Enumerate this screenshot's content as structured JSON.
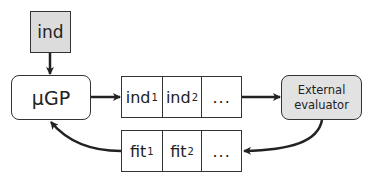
{
  "diagram": {
    "input_box": {
      "label": "ind"
    },
    "generator": {
      "label": "µGP"
    },
    "individuals_row": {
      "cells": [
        {
          "base": "ind",
          "sub": "1"
        },
        {
          "base": "ind",
          "sub": "2"
        },
        {
          "base": "...",
          "sub": ""
        }
      ]
    },
    "evaluator": {
      "line1": "External",
      "line2": "evaluator"
    },
    "fitness_row": {
      "cells": [
        {
          "base": "fit",
          "sub": "1"
        },
        {
          "base": "fit",
          "sub": "2"
        },
        {
          "base": "...",
          "sub": ""
        }
      ]
    },
    "colors": {
      "stroke": "#333333",
      "input_fill": "#dcdcdc",
      "evaluator_fill": "#e2e2e2",
      "background": "#ffffff"
    },
    "edges": [
      {
        "from": "input_box",
        "to": "generator"
      },
      {
        "from": "generator",
        "to": "individuals_row"
      },
      {
        "from": "individuals_row",
        "to": "evaluator"
      },
      {
        "from": "evaluator",
        "to": "fitness_row"
      },
      {
        "from": "fitness_row",
        "to": "generator"
      }
    ]
  }
}
